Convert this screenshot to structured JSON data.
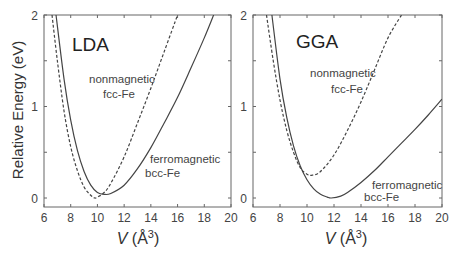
{
  "chart_data": [
    {
      "type": "line",
      "title": "LDA",
      "xlabel": "V (Å3)",
      "ylabel": "Relative Energy (eV)",
      "xlim": [
        6,
        20
      ],
      "ylim": [
        -0.1,
        2
      ],
      "xticks": [
        6,
        8,
        10,
        12,
        14,
        16,
        18,
        20
      ],
      "yticks": [
        0,
        1,
        2
      ],
      "grid": false,
      "series": [
        {
          "name": "ferromagnetic bcc-Fe",
          "style": "solid",
          "x": [
            6.9,
            7.5,
            8,
            8.5,
            9,
            9.5,
            10,
            10.5,
            11,
            12,
            13,
            14,
            15,
            16,
            17,
            18,
            18.7
          ],
          "y": [
            2.0,
            1.3,
            0.85,
            0.52,
            0.29,
            0.14,
            0.06,
            0.04,
            0.05,
            0.14,
            0.32,
            0.55,
            0.82,
            1.1,
            1.42,
            1.75,
            2.0
          ]
        },
        {
          "name": "nonmagnetic fcc-Fe",
          "style": "dashed",
          "x": [
            6.6,
            7,
            7.5,
            8,
            8.5,
            9,
            9.5,
            9.8,
            10,
            10.5,
            11,
            12,
            13,
            14,
            15,
            16
          ],
          "y": [
            2.0,
            1.5,
            0.95,
            0.56,
            0.3,
            0.12,
            0.03,
            0.0,
            0.01,
            0.06,
            0.16,
            0.45,
            0.82,
            1.2,
            1.6,
            2.0
          ]
        }
      ],
      "annotations": [
        {
          "text": "nonmagnetic",
          "x": 13,
          "y": 1.28
        },
        {
          "text": "fcc-Fe",
          "x": 13.4,
          "y": 1.1
        },
        {
          "text": "ferromagnetic",
          "x": 16.2,
          "y": 0.42
        },
        {
          "text": "bcc-Fe",
          "x": 15.5,
          "y": 0.26
        }
      ]
    },
    {
      "type": "line",
      "title": "GGA",
      "xlabel": "V (Å3)",
      "ylabel": "Relative Energy (eV)",
      "xlim": [
        6,
        20
      ],
      "ylim": [
        -0.1,
        2
      ],
      "xticks": [
        6,
        8,
        10,
        12,
        14,
        16,
        18,
        20
      ],
      "yticks": [
        0,
        1,
        2
      ],
      "grid": false,
      "series": [
        {
          "name": "ferromagnetic bcc-Fe",
          "style": "solid",
          "x": [
            7.4,
            8,
            8.5,
            9,
            9.5,
            10,
            10.5,
            11,
            11.5,
            11.8,
            12.5,
            13,
            14,
            15,
            16,
            17,
            18,
            19,
            20
          ],
          "y": [
            2.0,
            1.3,
            0.88,
            0.57,
            0.35,
            0.2,
            0.1,
            0.04,
            0.01,
            0.0,
            0.02,
            0.06,
            0.17,
            0.3,
            0.45,
            0.6,
            0.75,
            0.91,
            1.08
          ]
        },
        {
          "name": "nonmagnetic fcc-Fe",
          "style": "dashed",
          "x": [
            7.0,
            7.5,
            8,
            8.5,
            9,
            9.5,
            10,
            10.4,
            11,
            12,
            13,
            14,
            15,
            16,
            17
          ],
          "y": [
            2.0,
            1.5,
            1.07,
            0.74,
            0.5,
            0.33,
            0.26,
            0.25,
            0.29,
            0.47,
            0.74,
            1.05,
            1.4,
            1.75,
            2.0
          ]
        }
      ],
      "annotations": [
        {
          "text": "nonmagnetic",
          "x": 12.5,
          "y": 1.36
        },
        {
          "text": "fcc-Fe",
          "x": 13.5,
          "y": 1.18
        },
        {
          "text": "ferromagnetic",
          "x": 16.7,
          "y": 0.17
        },
        {
          "text": "bcc-Fe",
          "x": 15.5,
          "y": 0.02
        }
      ]
    }
  ],
  "labels": {
    "ylabel": "Relative Energy (eV)",
    "xlabel_var": "V",
    "xlabel_unit_open": " (Å",
    "xlabel_exp": "3",
    "xlabel_close": ")",
    "left_title": "LDA",
    "right_title": "GGA",
    "nm1": "nonmagnetic",
    "nm2": "fcc-Fe",
    "fm1": "ferromagnetic",
    "fm2": "bcc-Fe",
    "yt0": "0",
    "yt1": "1",
    "yt2": "2",
    "xt6": "6",
    "xt8": "8",
    "xt10": "10",
    "xt12": "12",
    "xt14": "14",
    "xt16": "16",
    "xt18": "18",
    "xt20": "20"
  }
}
